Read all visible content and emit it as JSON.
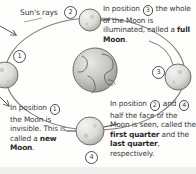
{
  "diagram": {
    "background_color": "#fdfdfc",
    "ink_color": "#3b3b3b"
  },
  "labels": {
    "sun_rays": "Sun's rays"
  },
  "position_markers": [
    {
      "id": "mk1",
      "number": "1"
    },
    {
      "id": "mk2",
      "number": "2"
    },
    {
      "id": "mk3",
      "number": "3"
    },
    {
      "id": "mk4",
      "number": "4"
    }
  ],
  "captions": {
    "full_moon": {
      "segments": [
        {
          "text": "In position ",
          "style": "plain"
        },
        {
          "text": "3",
          "style": "circled"
        },
        {
          "text": " the whole of the Moon is illuminated, called a ",
          "style": "plain"
        },
        {
          "text": "full Moon",
          "style": "bold"
        },
        {
          "text": ".",
          "style": "plain"
        }
      ]
    },
    "new_moon": {
      "segments": [
        {
          "text": "In position ",
          "style": "plain"
        },
        {
          "text": "1",
          "style": "circled"
        },
        {
          "text": " the Moon is invisible. This is called a ",
          "style": "plain"
        },
        {
          "text": "new Moon",
          "style": "bold"
        },
        {
          "text": ".",
          "style": "plain"
        }
      ]
    },
    "quarters": {
      "segments": [
        {
          "text": "In position ",
          "style": "plain"
        },
        {
          "text": "2",
          "style": "circled"
        },
        {
          "text": " and ",
          "style": "plain"
        },
        {
          "text": "4",
          "style": "circled"
        },
        {
          "text": " half the face of the Moon is seen, called the ",
          "style": "plain"
        },
        {
          "text": "first quarter",
          "style": "bold"
        },
        {
          "text": " and the ",
          "style": "plain"
        },
        {
          "text": "last quarter",
          "style": "bold"
        },
        {
          "text": ", respectively.",
          "style": "plain"
        }
      ]
    }
  },
  "bodies": {
    "earth": {
      "name": "Earth",
      "cx": 95,
      "cy": 70,
      "r": 22
    },
    "moons": [
      {
        "name": "Moon position 1 (new Moon)",
        "cx": 5,
        "cy": 75,
        "r": 13,
        "lit_side": "left"
      },
      {
        "name": "Moon position 2 (first quarter)",
        "cx": 90,
        "cy": 20,
        "r": 11,
        "lit_side": "left"
      },
      {
        "name": "Moon position 3 (full Moon)",
        "cx": 178,
        "cy": 77,
        "r": 13,
        "lit_side": "left"
      },
      {
        "name": "Moon position 4 (last quarter)",
        "cx": 90,
        "cy": 131,
        "r": 14,
        "lit_side": "left"
      }
    ],
    "orbit": {
      "cx": 95,
      "cy": 74,
      "rx": 90,
      "ry": 56
    }
  },
  "sun_ray_arrows": [
    {
      "x1": 0,
      "y1": 28,
      "x2": 18,
      "y2": 36
    },
    {
      "x1": 0,
      "y1": 99,
      "x2": 10,
      "y2": 108
    }
  ]
}
